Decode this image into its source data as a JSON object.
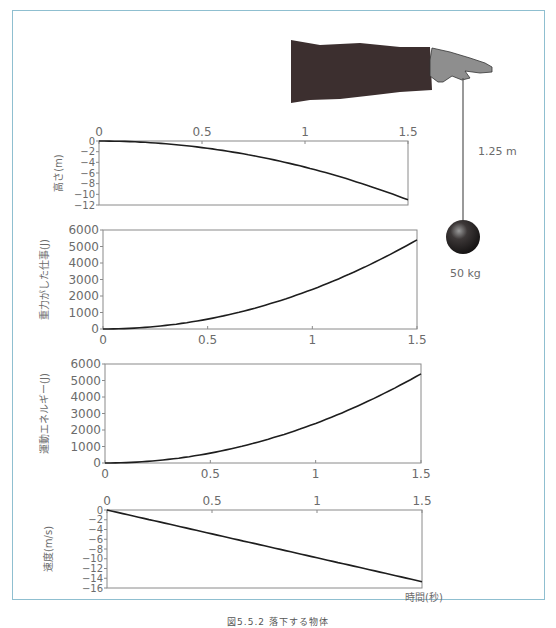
{
  "illustration": {
    "rope_length_label": "1.25 m",
    "mass_label": "50 kg",
    "arm_icon": "hand-holding-string",
    "ball_icon": "iron-ball"
  },
  "x_axis_title": "時間(秒)",
  "caption": "図5.5.2 落下する物体",
  "chart_data": [
    {
      "type": "line",
      "ylabel": "高さ(m)",
      "x": [
        0,
        0.25,
        0.5,
        0.75,
        1.0,
        1.25,
        1.5
      ],
      "values": [
        0,
        -0.31,
        -1.23,
        -2.76,
        -4.9,
        -7.66,
        -11.03
      ],
      "xticks": [
        "0",
        "0.5",
        "1",
        "1.5"
      ],
      "xtick_position": "top",
      "yticks": [
        "0",
        "−2",
        "−4",
        "−6",
        "−8",
        "−10",
        "−12"
      ],
      "xlim": [
        0,
        1.5
      ],
      "ylim": [
        -12,
        0
      ]
    },
    {
      "type": "line",
      "ylabel": "重力がした仕事(J)",
      "x": [
        0,
        0.25,
        0.5,
        0.75,
        1.0,
        1.25,
        1.5
      ],
      "values": [
        0,
        150,
        600,
        1351,
        2401,
        3752,
        5403
      ],
      "xticks": [
        "0",
        "0.5",
        "1",
        "1.5"
      ],
      "xtick_position": "bottom",
      "yticks": [
        "6000",
        "5000",
        "4000",
        "3000",
        "2000",
        "1000",
        "0"
      ],
      "xlim": [
        0,
        1.5
      ],
      "ylim": [
        0,
        6000
      ]
    },
    {
      "type": "line",
      "ylabel": "運動エネルギー(J)",
      "x": [
        0,
        0.25,
        0.5,
        0.75,
        1.0,
        1.25,
        1.5
      ],
      "values": [
        0,
        150,
        600,
        1351,
        2401,
        3752,
        5403
      ],
      "xticks": [
        "0",
        "0.5",
        "1",
        "1.5"
      ],
      "xtick_position": "bottom",
      "yticks": [
        "6000",
        "5000",
        "4000",
        "3000",
        "2000",
        "1000",
        "0"
      ],
      "xlim": [
        0,
        1.5
      ],
      "ylim": [
        0,
        6000
      ]
    },
    {
      "type": "line",
      "ylabel": "速度(m/s)",
      "x": [
        0,
        0.5,
        1.0,
        1.5
      ],
      "values": [
        0,
        -4.9,
        -9.8,
        -14.7
      ],
      "xticks": [
        "0",
        "0.5",
        "1",
        "1.5"
      ],
      "xtick_position": "top",
      "yticks": [
        "0",
        "−2",
        "−4",
        "−6",
        "−8",
        "−10",
        "−12",
        "−14",
        "−16"
      ],
      "xlim": [
        0,
        1.5
      ],
      "ylim": [
        -16,
        0
      ],
      "xlabel": "時間(秒)"
    }
  ]
}
